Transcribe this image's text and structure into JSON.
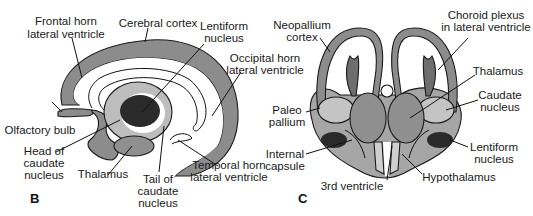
{
  "colors": {
    "cortex": "#8c8c8c",
    "caudate": "#bdbdbd",
    "lentiform": "#2a2a2a",
    "thalamus": "#8f8f8f",
    "ventricle": "#ffffff",
    "hypothalamus": "#cfcfcf",
    "choroid": "#6e6e6e"
  },
  "panel_b": {
    "letter": "B",
    "labels": {
      "frontal_horn_1": "Frontal horn",
      "frontal_horn_2": "lateral ventricle",
      "cerebral_cortex": "Cerebral cortex",
      "lentiform_1": "Lentiform",
      "lentiform_2": "nucleus",
      "occipital_1": "Occipital horn",
      "occipital_2": "lateral ventricle",
      "olfactory": "Olfactory bulb",
      "head_caudate_1": "Head of",
      "head_caudate_2": "caudate",
      "head_caudate_3": "nucleus",
      "thalamus": "Thalamus",
      "tail_caudate_1": "Tail of",
      "tail_caudate_2": "caudate",
      "tail_caudate_3": "nucleus",
      "temporal_1": "Temporal horn",
      "temporal_2": "lateral ventricle"
    }
  },
  "panel_c": {
    "letter": "C",
    "labels": {
      "neopallium_1": "Neopallium",
      "neopallium_2": "cortex",
      "choroid_1": "Choroid plexus",
      "choroid_2": "in lateral ventricle",
      "thalamus": "Thalamus",
      "caudate_1": "Caudate",
      "caudate_2": "nucleus",
      "paleo_1": "Paleo",
      "paleo_2": "pallium",
      "internal_1": "Internal",
      "internal_2": "capsule",
      "lentiform_1": "Lentiform",
      "lentiform_2": "nucleus",
      "third_ventricle": "3rd ventricle",
      "hypothalamus": "Hypothalamus"
    }
  }
}
